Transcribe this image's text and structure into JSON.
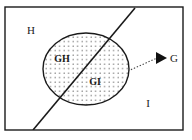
{
  "figure": {
    "type": "set-venn-diagram",
    "background_color": "#ffffff",
    "stroke_color": "#1a1a1a"
  },
  "universe_rect": {
    "name": "universe-boundary",
    "x": 5,
    "y": 7,
    "width": 178,
    "height": 123,
    "stroke_width": 1.4
  },
  "ellipse": {
    "name": "set-G-ellipse",
    "cx": 86,
    "cy": 69,
    "rx": 43,
    "ry": 36,
    "stroke_width": 1.4,
    "fill_pattern": "dots",
    "dot_color": "#555555",
    "dot_spacing": 4.5
  },
  "divider_line": {
    "name": "partition-line",
    "x1": 135,
    "y1": 8,
    "x2": 33,
    "y2": 130,
    "stroke_width": 1.6
  },
  "leader": {
    "name": "callout-leader",
    "x1": 128,
    "y1": 71,
    "x2": 157,
    "y2": 58,
    "dash": "1.4 1.8",
    "stroke_width": 1.1,
    "arrowhead": {
      "tip_x": 167,
      "tip_y": 58,
      "back_x": 156,
      "back_y": 52,
      "back2_x": 156,
      "back2_y": 64
    }
  },
  "labels": {
    "region_h": {
      "text": "H",
      "x": 31,
      "y": 34
    },
    "region_gh": {
      "text": "GH",
      "x": 62,
      "y": 62
    },
    "region_gi": {
      "text": "GI",
      "x": 95,
      "y": 85
    },
    "region_i": {
      "text": "I",
      "x": 148,
      "y": 107
    },
    "set_g": {
      "text": "G",
      "x": 174,
      "y": 62
    }
  }
}
